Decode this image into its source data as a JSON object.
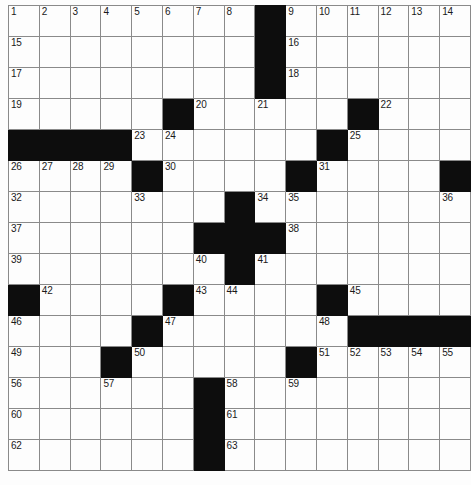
{
  "puzzle": {
    "title": "Crossword Grid",
    "rows": 15,
    "columns": 15,
    "cell_size_px": 31,
    "colors": {
      "block": "#0d0d0d",
      "cell": "#fdfdfd",
      "grid_line": "#8a8a8a",
      "number_text": "#1a1a1a",
      "page_background": "#ffffff"
    },
    "numbering": {
      "first": 1,
      "last": 63,
      "count": 63
    },
    "grid": [
      [
        {
          "type": "cell",
          "number": "1"
        },
        {
          "type": "cell",
          "number": "2"
        },
        {
          "type": "cell",
          "number": "3"
        },
        {
          "type": "cell",
          "number": "4"
        },
        {
          "type": "cell",
          "number": "5"
        },
        {
          "type": "cell",
          "number": "6"
        },
        {
          "type": "cell",
          "number": "7"
        },
        {
          "type": "cell",
          "number": "8"
        },
        {
          "type": "block",
          "number": ""
        },
        {
          "type": "cell",
          "number": "9"
        },
        {
          "type": "cell",
          "number": "10"
        },
        {
          "type": "cell",
          "number": "11"
        },
        {
          "type": "cell",
          "number": "12"
        },
        {
          "type": "cell",
          "number": "13"
        },
        {
          "type": "cell",
          "number": "14"
        }
      ],
      [
        {
          "type": "cell",
          "number": "15"
        },
        {
          "type": "cell",
          "number": ""
        },
        {
          "type": "cell",
          "number": ""
        },
        {
          "type": "cell",
          "number": ""
        },
        {
          "type": "cell",
          "number": ""
        },
        {
          "type": "cell",
          "number": ""
        },
        {
          "type": "cell",
          "number": ""
        },
        {
          "type": "cell",
          "number": ""
        },
        {
          "type": "block",
          "number": ""
        },
        {
          "type": "cell",
          "number": "16"
        },
        {
          "type": "cell",
          "number": ""
        },
        {
          "type": "cell",
          "number": ""
        },
        {
          "type": "cell",
          "number": ""
        },
        {
          "type": "cell",
          "number": ""
        },
        {
          "type": "cell",
          "number": ""
        }
      ],
      [
        {
          "type": "cell",
          "number": "17"
        },
        {
          "type": "cell",
          "number": ""
        },
        {
          "type": "cell",
          "number": ""
        },
        {
          "type": "cell",
          "number": ""
        },
        {
          "type": "cell",
          "number": ""
        },
        {
          "type": "cell",
          "number": ""
        },
        {
          "type": "cell",
          "number": ""
        },
        {
          "type": "cell",
          "number": ""
        },
        {
          "type": "block",
          "number": ""
        },
        {
          "type": "cell",
          "number": "18"
        },
        {
          "type": "cell",
          "number": ""
        },
        {
          "type": "cell",
          "number": ""
        },
        {
          "type": "cell",
          "number": ""
        },
        {
          "type": "cell",
          "number": ""
        },
        {
          "type": "cell",
          "number": ""
        }
      ],
      [
        {
          "type": "cell",
          "number": "19"
        },
        {
          "type": "cell",
          "number": ""
        },
        {
          "type": "cell",
          "number": ""
        },
        {
          "type": "cell",
          "number": ""
        },
        {
          "type": "cell",
          "number": ""
        },
        {
          "type": "block",
          "number": ""
        },
        {
          "type": "cell",
          "number": "20"
        },
        {
          "type": "cell",
          "number": ""
        },
        {
          "type": "cell",
          "number": "21"
        },
        {
          "type": "cell",
          "number": ""
        },
        {
          "type": "cell",
          "number": ""
        },
        {
          "type": "block",
          "number": ""
        },
        {
          "type": "cell",
          "number": "22"
        },
        {
          "type": "cell",
          "number": ""
        },
        {
          "type": "cell",
          "number": ""
        }
      ],
      [
        {
          "type": "block",
          "number": ""
        },
        {
          "type": "block",
          "number": ""
        },
        {
          "type": "block",
          "number": ""
        },
        {
          "type": "block",
          "number": ""
        },
        {
          "type": "cell",
          "number": "23"
        },
        {
          "type": "cell",
          "number": "24"
        },
        {
          "type": "cell",
          "number": ""
        },
        {
          "type": "cell",
          "number": ""
        },
        {
          "type": "cell",
          "number": ""
        },
        {
          "type": "cell",
          "number": ""
        },
        {
          "type": "block",
          "number": ""
        },
        {
          "type": "cell",
          "number": "25"
        },
        {
          "type": "cell",
          "number": ""
        },
        {
          "type": "cell",
          "number": ""
        },
        {
          "type": "cell",
          "number": ""
        }
      ],
      [
        {
          "type": "cell",
          "number": "26"
        },
        {
          "type": "cell",
          "number": "27"
        },
        {
          "type": "cell",
          "number": "28"
        },
        {
          "type": "cell",
          "number": "29"
        },
        {
          "type": "block",
          "number": ""
        },
        {
          "type": "cell",
          "number": "30"
        },
        {
          "type": "cell",
          "number": ""
        },
        {
          "type": "cell",
          "number": ""
        },
        {
          "type": "cell",
          "number": ""
        },
        {
          "type": "block",
          "number": ""
        },
        {
          "type": "cell",
          "number": "31"
        },
        {
          "type": "cell",
          "number": ""
        },
        {
          "type": "cell",
          "number": ""
        },
        {
          "type": "cell",
          "number": ""
        },
        {
          "type": "block",
          "number": ""
        }
      ],
      [
        {
          "type": "cell",
          "number": "32"
        },
        {
          "type": "cell",
          "number": ""
        },
        {
          "type": "cell",
          "number": ""
        },
        {
          "type": "cell",
          "number": ""
        },
        {
          "type": "cell",
          "number": "33"
        },
        {
          "type": "cell",
          "number": ""
        },
        {
          "type": "cell",
          "number": ""
        },
        {
          "type": "block",
          "number": ""
        },
        {
          "type": "cell",
          "number": "34"
        },
        {
          "type": "cell",
          "number": "35"
        },
        {
          "type": "cell",
          "number": ""
        },
        {
          "type": "cell",
          "number": ""
        },
        {
          "type": "cell",
          "number": ""
        },
        {
          "type": "cell",
          "number": ""
        },
        {
          "type": "cell",
          "number": "36"
        }
      ],
      [
        {
          "type": "cell",
          "number": "37"
        },
        {
          "type": "cell",
          "number": ""
        },
        {
          "type": "cell",
          "number": ""
        },
        {
          "type": "cell",
          "number": ""
        },
        {
          "type": "cell",
          "number": ""
        },
        {
          "type": "cell",
          "number": ""
        },
        {
          "type": "block",
          "number": ""
        },
        {
          "type": "block",
          "number": ""
        },
        {
          "type": "block",
          "number": ""
        },
        {
          "type": "cell",
          "number": "38"
        },
        {
          "type": "cell",
          "number": ""
        },
        {
          "type": "cell",
          "number": ""
        },
        {
          "type": "cell",
          "number": ""
        },
        {
          "type": "cell",
          "number": ""
        },
        {
          "type": "cell",
          "number": ""
        }
      ],
      [
        {
          "type": "cell",
          "number": "39"
        },
        {
          "type": "cell",
          "number": ""
        },
        {
          "type": "cell",
          "number": ""
        },
        {
          "type": "cell",
          "number": ""
        },
        {
          "type": "cell",
          "number": ""
        },
        {
          "type": "cell",
          "number": ""
        },
        {
          "type": "cell",
          "number": "40"
        },
        {
          "type": "block",
          "number": ""
        },
        {
          "type": "cell",
          "number": "41"
        },
        {
          "type": "cell",
          "number": ""
        },
        {
          "type": "cell",
          "number": ""
        },
        {
          "type": "cell",
          "number": ""
        },
        {
          "type": "cell",
          "number": ""
        },
        {
          "type": "cell",
          "number": ""
        },
        {
          "type": "cell",
          "number": ""
        }
      ],
      [
        {
          "type": "block",
          "number": ""
        },
        {
          "type": "cell",
          "number": "42"
        },
        {
          "type": "cell",
          "number": ""
        },
        {
          "type": "cell",
          "number": ""
        },
        {
          "type": "cell",
          "number": ""
        },
        {
          "type": "block",
          "number": ""
        },
        {
          "type": "cell",
          "number": "43"
        },
        {
          "type": "cell",
          "number": "44"
        },
        {
          "type": "cell",
          "number": ""
        },
        {
          "type": "cell",
          "number": ""
        },
        {
          "type": "block",
          "number": ""
        },
        {
          "type": "cell",
          "number": "45"
        },
        {
          "type": "cell",
          "number": ""
        },
        {
          "type": "cell",
          "number": ""
        },
        {
          "type": "cell",
          "number": ""
        }
      ],
      [
        {
          "type": "cell",
          "number": "46"
        },
        {
          "type": "cell",
          "number": ""
        },
        {
          "type": "cell",
          "number": ""
        },
        {
          "type": "cell",
          "number": ""
        },
        {
          "type": "block",
          "number": ""
        },
        {
          "type": "cell",
          "number": "47"
        },
        {
          "type": "cell",
          "number": ""
        },
        {
          "type": "cell",
          "number": ""
        },
        {
          "type": "cell",
          "number": ""
        },
        {
          "type": "cell",
          "number": ""
        },
        {
          "type": "cell",
          "number": "48"
        },
        {
          "type": "block",
          "number": ""
        },
        {
          "type": "block",
          "number": ""
        },
        {
          "type": "block",
          "number": ""
        },
        {
          "type": "block",
          "number": ""
        }
      ],
      [
        {
          "type": "cell",
          "number": "49"
        },
        {
          "type": "cell",
          "number": ""
        },
        {
          "type": "cell",
          "number": ""
        },
        {
          "type": "block",
          "number": ""
        },
        {
          "type": "cell",
          "number": "50"
        },
        {
          "type": "cell",
          "number": ""
        },
        {
          "type": "cell",
          "number": ""
        },
        {
          "type": "cell",
          "number": ""
        },
        {
          "type": "cell",
          "number": ""
        },
        {
          "type": "block",
          "number": ""
        },
        {
          "type": "cell",
          "number": "51"
        },
        {
          "type": "cell",
          "number": "52"
        },
        {
          "type": "cell",
          "number": "53"
        },
        {
          "type": "cell",
          "number": "54"
        },
        {
          "type": "cell",
          "number": "55"
        }
      ],
      [
        {
          "type": "cell",
          "number": "56"
        },
        {
          "type": "cell",
          "number": ""
        },
        {
          "type": "cell",
          "number": ""
        },
        {
          "type": "cell",
          "number": "57"
        },
        {
          "type": "cell",
          "number": ""
        },
        {
          "type": "cell",
          "number": ""
        },
        {
          "type": "block",
          "number": ""
        },
        {
          "type": "cell",
          "number": "58"
        },
        {
          "type": "cell",
          "number": ""
        },
        {
          "type": "cell",
          "number": "59"
        },
        {
          "type": "cell",
          "number": ""
        },
        {
          "type": "cell",
          "number": ""
        },
        {
          "type": "cell",
          "number": ""
        },
        {
          "type": "cell",
          "number": ""
        },
        {
          "type": "cell",
          "number": ""
        }
      ],
      [
        {
          "type": "cell",
          "number": "60"
        },
        {
          "type": "cell",
          "number": ""
        },
        {
          "type": "cell",
          "number": ""
        },
        {
          "type": "cell",
          "number": ""
        },
        {
          "type": "cell",
          "number": ""
        },
        {
          "type": "cell",
          "number": ""
        },
        {
          "type": "block",
          "number": ""
        },
        {
          "type": "cell",
          "number": "61"
        },
        {
          "type": "cell",
          "number": ""
        },
        {
          "type": "cell",
          "number": ""
        },
        {
          "type": "cell",
          "number": ""
        },
        {
          "type": "cell",
          "number": ""
        },
        {
          "type": "cell",
          "number": ""
        },
        {
          "type": "cell",
          "number": ""
        },
        {
          "type": "cell",
          "number": ""
        }
      ],
      [
        {
          "type": "cell",
          "number": "62"
        },
        {
          "type": "cell",
          "number": ""
        },
        {
          "type": "cell",
          "number": ""
        },
        {
          "type": "cell",
          "number": ""
        },
        {
          "type": "cell",
          "number": ""
        },
        {
          "type": "cell",
          "number": ""
        },
        {
          "type": "block",
          "number": ""
        },
        {
          "type": "cell",
          "number": "63"
        },
        {
          "type": "cell",
          "number": ""
        },
        {
          "type": "cell",
          "number": ""
        },
        {
          "type": "cell",
          "number": ""
        },
        {
          "type": "cell",
          "number": ""
        },
        {
          "type": "cell",
          "number": ""
        },
        {
          "type": "cell",
          "number": ""
        },
        {
          "type": "cell",
          "number": ""
        }
      ]
    ]
  }
}
